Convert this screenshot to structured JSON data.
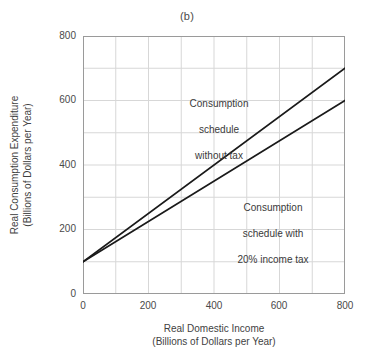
{
  "chart_data": {
    "type": "line",
    "title": "(b)",
    "xlabel": "Real Domestic Income\n(Billions of Dollars per Year)",
    "xlabel_line1": "Real Domestic Income",
    "xlabel_line2": "(Billions of Dollars per Year)",
    "ylabel": "Real Consumption Expenditure\n(Billions of Dollars per Year)",
    "ylabel_line1": "Real Consumption Expenditure",
    "ylabel_line2": "(Billions of Dollars per Year)",
    "xlim": [
      0,
      800
    ],
    "ylim": [
      0,
      800
    ],
    "xticks": [
      0,
      200,
      400,
      600,
      800
    ],
    "yticks": [
      0,
      200,
      400,
      600,
      800
    ],
    "xtick_labels": [
      "0",
      "200",
      "400",
      "600",
      "800"
    ],
    "ytick_labels": [
      "0",
      "200",
      "400",
      "600",
      "800"
    ],
    "grid": true,
    "grid_step": 100,
    "legend": "none",
    "series": [
      {
        "name": "Consumption schedule without tax",
        "color": "#1a1a1a",
        "x": [
          0,
          800
        ],
        "values": [
          100,
          700
        ],
        "intercept": 100,
        "slope": 0.75
      },
      {
        "name": "Consumption schedule with 20% income tax",
        "color": "#1a1a1a",
        "x": [
          0,
          800
        ],
        "values": [
          100,
          600
        ],
        "intercept": 100,
        "slope": 0.625
      }
    ],
    "annotations": [
      {
        "text": "Consumption\nschedule\nwithout tax",
        "line1": "Consumption",
        "line2": "schedule",
        "line3": "without tax",
        "x": 330,
        "y": 620
      },
      {
        "text": "Consumption\nschedule with\n20% income tax",
        "line1": "Consumption",
        "line2": "schedule with",
        "line3": "20% income tax",
        "x": 540,
        "y": 330
      }
    ]
  },
  "colors": {
    "line": "#1a1a1a",
    "grid": "#d7d7d7",
    "axis": "#9a9a9a",
    "text": "#3a3a3a",
    "background": "#ffffff"
  }
}
